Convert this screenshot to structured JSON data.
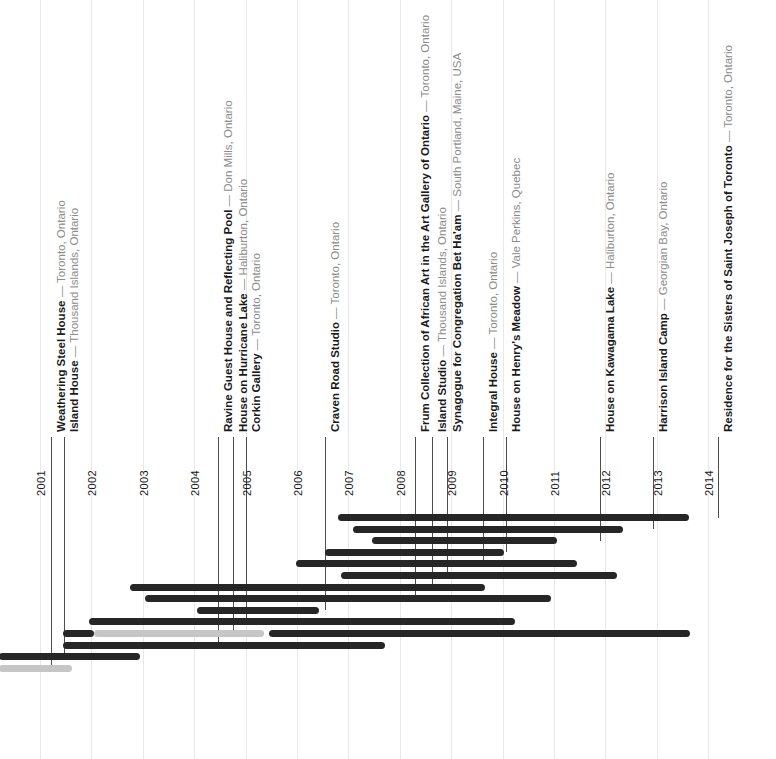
{
  "chart_data": {
    "type": "bar",
    "subtype": "gantt-timeline",
    "title": "",
    "xlabel": "",
    "ylabel": "",
    "grid": true,
    "legend": null,
    "axis": {
      "tick_labels": [
        "2001",
        "2002",
        "2003",
        "2004",
        "2005",
        "2006",
        "2007",
        "2008",
        "2009",
        "2010",
        "2011",
        "2012",
        "2013",
        "2014"
      ],
      "x_start_year": 2001,
      "x_end_year": 2014,
      "xlim": [
        2000.2,
        2014.3
      ]
    },
    "colors": {
      "bar_active": "#262626",
      "bar_inactive": "#c6c6c6",
      "gridline": "#e8e8e8",
      "leader_line": "#4d4d4d",
      "label_name": "#1a1a1a",
      "label_location": "#8c8c8c",
      "background": "#ffffff"
    },
    "projects": [
      {
        "name": "Weathering Steel House",
        "location": "Toronto, Ontario",
        "label_x": 51,
        "segments": [
          {
            "start": 2000.2,
            "end": 2001.62,
            "state": "inactive"
          }
        ]
      },
      {
        "name": "Island House",
        "location": "Thousand Islands, Ontario",
        "label_x": 64,
        "segments": [
          {
            "start": 2000.2,
            "end": 2002.95,
            "state": "active"
          }
        ]
      },
      {
        "name": "Ravine Guest House and Reflecting Pool",
        "location": "Don Mills, Ontario",
        "label_x": 218,
        "segments": [
          {
            "start": 2001.45,
            "end": 2007.72,
            "state": "active"
          }
        ]
      },
      {
        "name": "House on Hurricane Lake",
        "location": "Haliburton, Ontario",
        "label_x": 233,
        "segments": [
          {
            "start": 2001.45,
            "end": 2002.05,
            "state": "active"
          },
          {
            "start": 2002.05,
            "end": 2005.35,
            "state": "inactive"
          },
          {
            "start": 2005.45,
            "end": 2013.65,
            "state": "active"
          }
        ]
      },
      {
        "name": "Corkin Gallery",
        "location": "Toronto, Ontario",
        "label_x": 246,
        "segments": [
          {
            "start": 2001.95,
            "end": 2010.25,
            "state": "active"
          }
        ]
      },
      {
        "name": "Craven Road Studio",
        "location": "Toronto, Ontario",
        "label_x": 325,
        "segments": [
          {
            "start": 2004.05,
            "end": 2006.42,
            "state": "active"
          }
        ]
      },
      {
        "name": "Frum Collection of African Art in the Art Gallery of Ontario",
        "location": "Toronto, Ontario",
        "label_x": 415,
        "segments": [
          {
            "start": 2003.05,
            "end": 2010.95,
            "state": "active"
          }
        ]
      },
      {
        "name": "Island Studio",
        "location": "Thousand Islands, Ontario",
        "label_x": 432,
        "segments": [
          {
            "start": 2002.75,
            "end": 2009.65,
            "state": "active"
          }
        ]
      },
      {
        "name": "Synagogue for Congregation Bet Ha'am",
        "location": "South Portland, Maine, USA",
        "label_x": 447,
        "segments": [
          {
            "start": 2006.85,
            "end": 2012.22,
            "state": "active"
          }
        ]
      },
      {
        "name": "Integral House",
        "location": "Toronto, Ontario",
        "label_x": 483,
        "segments": [
          {
            "start": 2005.98,
            "end": 2011.45,
            "state": "active"
          }
        ]
      },
      {
        "name": "House on Henry's Meadow",
        "location": "Vale Perkins, Quebec",
        "label_x": 506,
        "segments": [
          {
            "start": 2006.55,
            "end": 2010.02,
            "state": "active"
          }
        ]
      },
      {
        "name": "House on Kawagama Lake",
        "location": "Haliburton, Ontario",
        "label_x": 600,
        "segments": [
          {
            "start": 2007.45,
            "end": 2011.05,
            "state": "active"
          }
        ]
      },
      {
        "name": "Harrison Island Camp",
        "location": "Georgian Bay, Ontario",
        "label_x": 653,
        "segments": [
          {
            "start": 2007.08,
            "end": 2012.35,
            "state": "active"
          }
        ]
      },
      {
        "name": "Residence for the Sisters of Saint Joseph of Toronto",
        "location": "Toronto, Ontario",
        "label_x": 718,
        "segments": [
          {
            "start": 2006.8,
            "end": 2013.63,
            "state": "active"
          }
        ]
      }
    ]
  },
  "meta": {
    "em_dash": " — "
  }
}
